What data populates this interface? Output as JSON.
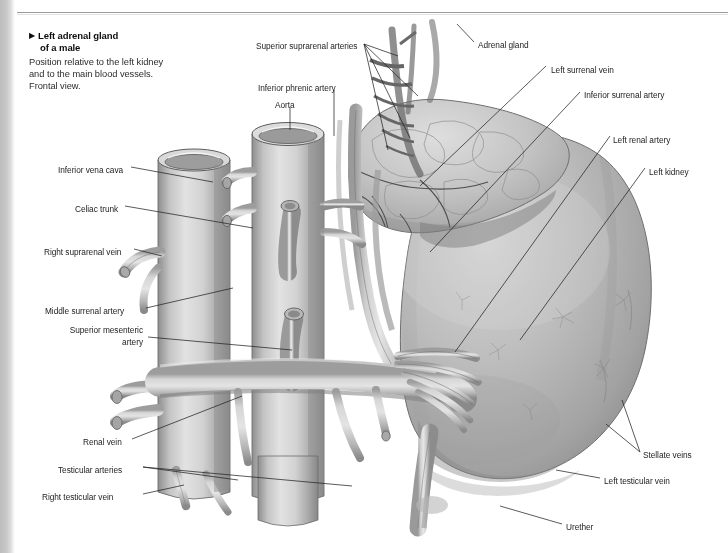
{
  "figure": {
    "caption": {
      "marker": "▶",
      "title_line1": "Left adrenal gland",
      "title_line2": "of a male",
      "body": "Position relative to the left kidney and to the main blood vessels. Frontal view."
    },
    "illustration": {
      "description": "Grayscale anatomical drawing, frontal view, of the left adrenal gland and left kidney with the inferior vena cava, aorta and their branches",
      "style": "pencil-shaded medical illustration",
      "base_color": "#b9b9b9",
      "outline_color": "#4a4a4a"
    },
    "labels": [
      {
        "id": "superior-suprarenal-arteries",
        "text": "Superior suprarenal arteries",
        "x": 256,
        "y": 46,
        "align": "left"
      },
      {
        "id": "inferior-phrenic-artery",
        "text": "Inferior phrenic artery",
        "x": 258,
        "y": 88,
        "align": "left"
      },
      {
        "id": "aorta",
        "text": "Aorta",
        "x": 275,
        "y": 105,
        "align": "left"
      },
      {
        "id": "adrenal-gland",
        "text": "Adrenal gland",
        "x": 478,
        "y": 45,
        "align": "left"
      },
      {
        "id": "left-surrenal-vein",
        "text": "Left surrenal vein",
        "x": 551,
        "y": 70,
        "align": "left"
      },
      {
        "id": "inferior-surrenal-artery",
        "text": "Inferior surrenal artery",
        "x": 584,
        "y": 95,
        "align": "left"
      },
      {
        "id": "left-renal-artery",
        "text": "Left renal artery",
        "x": 613,
        "y": 140,
        "align": "left"
      },
      {
        "id": "left-kidney",
        "text": "Left kidney",
        "x": 649,
        "y": 172,
        "align": "left"
      },
      {
        "id": "stellate-veins",
        "text": "Stellate veins",
        "x": 643,
        "y": 455,
        "align": "left"
      },
      {
        "id": "left-testicular-vein",
        "text": "Left testicular vein",
        "x": 604,
        "y": 481,
        "align": "left"
      },
      {
        "id": "urether",
        "text": "Urether",
        "x": 566,
        "y": 527,
        "align": "left"
      },
      {
        "id": "inferior-vena-cava",
        "text": "Inferior vena cava",
        "x": 58,
        "y": 170,
        "align": "left"
      },
      {
        "id": "celiac-trunk",
        "text": "Celiac trunk",
        "x": 75,
        "y": 209,
        "align": "left"
      },
      {
        "id": "right-suprarenal-vein",
        "text": "Right suprarenal vein",
        "x": 44,
        "y": 252,
        "align": "left"
      },
      {
        "id": "middle-surrenal-artery",
        "text": "Middle surrenal artery",
        "x": 45,
        "y": 311,
        "align": "left"
      },
      {
        "id": "superior-mesenteric-artery",
        "text": "Superior mesenteric artery",
        "x": 51,
        "y": 330,
        "align": "right-wrap"
      },
      {
        "id": "renal-vein",
        "text": "Renal vein",
        "x": 83,
        "y": 442,
        "align": "left"
      },
      {
        "id": "testicular-arteries",
        "text": "Testicular arteries",
        "x": 58,
        "y": 470,
        "align": "left"
      },
      {
        "id": "right-testicular-vein",
        "text": "Right testicular vein",
        "x": 42,
        "y": 497,
        "align": "left"
      }
    ]
  }
}
